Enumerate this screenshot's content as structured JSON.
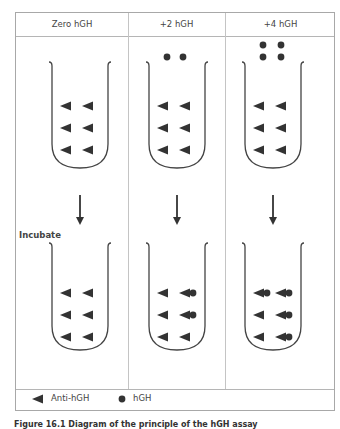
{
  "columns": [
    {
      "label": "Zero hGH",
      "free_hgh_top": 0,
      "rows": [
        [
          false,
          false
        ],
        [
          false,
          false
        ],
        [
          false,
          false
        ]
      ]
    },
    {
      "label": "+2 hGH",
      "free_hgh_top": 2,
      "rows": [
        [
          false,
          true
        ],
        [
          false,
          true
        ],
        [
          false,
          false
        ]
      ]
    },
    {
      "label": "+4 hGH",
      "free_hgh_top": 4,
      "rows": [
        [
          true,
          true
        ],
        [
          false,
          true
        ],
        [
          false,
          true
        ]
      ]
    }
  ],
  "incubate_label": "Incubate",
  "legend": {
    "antibody_label": "Anti-hGH",
    "hormone_label": "hGH"
  },
  "caption": "Figure 16.1 Diagram of the principle of the hGH assay",
  "colors": {
    "shape": "#333333",
    "tube": "#444444",
    "frame": "#a8a8a8"
  }
}
